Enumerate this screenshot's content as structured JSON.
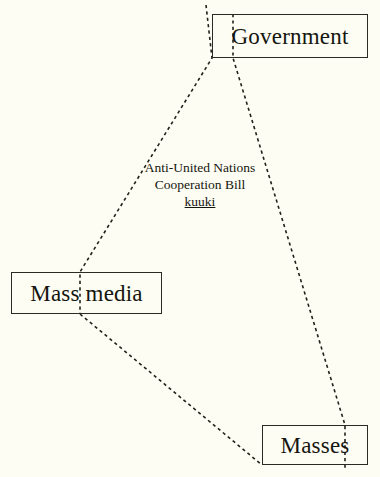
{
  "diagram": {
    "background_color": "#fdfdf3",
    "ink_color": "#15150f",
    "nodes": [
      {
        "id": "government",
        "label": "Government"
      },
      {
        "id": "mass-media",
        "label": "Mass media"
      },
      {
        "id": "masses",
        "label": "Masses"
      }
    ],
    "annotation": {
      "line1": "Anti-United Nations",
      "line2": "Cooperation Bill",
      "line3_underlined": "kuuki"
    },
    "edges": [
      {
        "id": "government-to-mass-media",
        "from": "government",
        "to": "mass-media",
        "style": "dashed",
        "path": "M 206 5 L 212 58 L 80 272 L 80 314"
      },
      {
        "id": "government-to-masses",
        "from": "government",
        "to": "masses",
        "style": "dashed",
        "path": "M 233 14 L 233 58 L 345 425 L 345 470"
      },
      {
        "id": "mass-media-to-masses",
        "from": "mass-media",
        "to": "masses",
        "style": "dashed",
        "path": "M 80 314 L 262 465"
      }
    ]
  }
}
